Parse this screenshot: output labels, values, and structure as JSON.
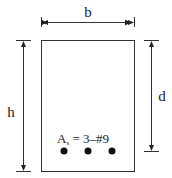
{
  "diagram": {
    "labels": {
      "width": "b",
      "height": "h",
      "effective_depth": "d",
      "steel_area_symbol": "A",
      "steel_area_subscript": "s",
      "steel_area_value": " = 3–#9"
    },
    "reinforcement": {
      "count": 3,
      "bar_size": "#9"
    },
    "colors": {
      "stroke": "#333333",
      "bar_fill": "#111111",
      "background": "#ffffff"
    }
  }
}
